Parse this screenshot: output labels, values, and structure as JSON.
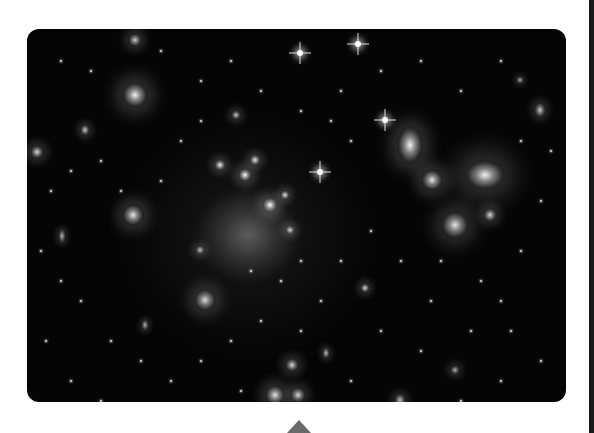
{
  "image": {
    "alt": "Grayscale telescope image of a galaxy cluster with many bright elliptical galaxies, diffraction-spike stars and faint arcs",
    "background_color": "#050505",
    "corner_radius_px": 12
  },
  "pointer": {
    "color": "#6a6a6a",
    "shape": "triangle-up"
  },
  "edge_bar": {
    "color": "#1a1a1a"
  },
  "galaxies": [
    {
      "x": 248,
      "y": 235,
      "w": 120,
      "h": 110,
      "b": 0.35
    },
    {
      "x": 270,
      "y": 205,
      "w": 16,
      "h": 16,
      "b": 1
    },
    {
      "x": 245,
      "y": 175,
      "w": 14,
      "h": 14,
      "b": 1
    },
    {
      "x": 220,
      "y": 165,
      "w": 12,
      "h": 12,
      "b": 0.95
    },
    {
      "x": 255,
      "y": 160,
      "w": 12,
      "h": 12,
      "b": 0.9
    },
    {
      "x": 285,
      "y": 195,
      "w": 10,
      "h": 10,
      "b": 0.9
    },
    {
      "x": 290,
      "y": 230,
      "w": 10,
      "h": 10,
      "b": 0.85
    },
    {
      "x": 410,
      "y": 145,
      "w": 26,
      "h": 38,
      "b": 0.95
    },
    {
      "x": 485,
      "y": 175,
      "w": 40,
      "h": 30,
      "b": 0.95
    },
    {
      "x": 432,
      "y": 180,
      "w": 22,
      "h": 22,
      "b": 0.9
    },
    {
      "x": 455,
      "y": 225,
      "w": 28,
      "h": 28,
      "b": 0.9
    },
    {
      "x": 490,
      "y": 215,
      "w": 14,
      "h": 14,
      "b": 0.85
    },
    {
      "x": 135,
      "y": 95,
      "w": 26,
      "h": 26,
      "b": 0.95
    },
    {
      "x": 133,
      "y": 215,
      "w": 22,
      "h": 22,
      "b": 0.9
    },
    {
      "x": 205,
      "y": 300,
      "w": 22,
      "h": 22,
      "b": 0.85
    },
    {
      "x": 275,
      "y": 395,
      "w": 20,
      "h": 20,
      "b": 0.9
    },
    {
      "x": 298,
      "y": 395,
      "w": 16,
      "h": 16,
      "b": 0.85
    },
    {
      "x": 292,
      "y": 365,
      "w": 14,
      "h": 14,
      "b": 0.85
    },
    {
      "x": 170,
      "y": 435,
      "w": 18,
      "h": 24,
      "b": 0.85
    },
    {
      "x": 135,
      "y": 40,
      "w": 14,
      "h": 14,
      "b": 0.8
    },
    {
      "x": 37,
      "y": 152,
      "w": 14,
      "h": 14,
      "b": 0.85
    },
    {
      "x": 540,
      "y": 110,
      "w": 12,
      "h": 16,
      "b": 0.8
    },
    {
      "x": 365,
      "y": 288,
      "w": 10,
      "h": 10,
      "b": 0.85
    },
    {
      "x": 236,
      "y": 115,
      "w": 10,
      "h": 10,
      "b": 0.8
    },
    {
      "x": 85,
      "y": 130,
      "w": 10,
      "h": 12,
      "b": 0.8
    },
    {
      "x": 326,
      "y": 353,
      "w": 8,
      "h": 12,
      "b": 0.75
    },
    {
      "x": 200,
      "y": 250,
      "w": 10,
      "h": 10,
      "b": 0.75
    },
    {
      "x": 62,
      "y": 236,
      "w": 8,
      "h": 16,
      "b": 0.7
    },
    {
      "x": 145,
      "y": 325,
      "w": 8,
      "h": 12,
      "b": 0.7
    },
    {
      "x": 520,
      "y": 80,
      "w": 8,
      "h": 8,
      "b": 0.7
    },
    {
      "x": 400,
      "y": 400,
      "w": 12,
      "h": 14,
      "b": 0.75
    },
    {
      "x": 530,
      "y": 415,
      "w": 12,
      "h": 10,
      "b": 0.7
    },
    {
      "x": 455,
      "y": 370,
      "w": 10,
      "h": 10,
      "b": 0.7
    }
  ],
  "stars": [
    {
      "x": 358,
      "y": 44
    },
    {
      "x": 300,
      "y": 53
    },
    {
      "x": 385,
      "y": 120
    },
    {
      "x": 320,
      "y": 172
    }
  ],
  "dots": [
    [
      60,
      60
    ],
    [
      90,
      70
    ],
    [
      160,
      50
    ],
    [
      200,
      80
    ],
    [
      230,
      60
    ],
    [
      260,
      90
    ],
    [
      300,
      110
    ],
    [
      340,
      90
    ],
    [
      380,
      70
    ],
    [
      420,
      60
    ],
    [
      460,
      90
    ],
    [
      500,
      60
    ],
    [
      520,
      140
    ],
    [
      550,
      150
    ],
    [
      540,
      200
    ],
    [
      520,
      250
    ],
    [
      500,
      300
    ],
    [
      470,
      330
    ],
    [
      430,
      300
    ],
    [
      400,
      260
    ],
    [
      370,
      230
    ],
    [
      340,
      260
    ],
    [
      320,
      300
    ],
    [
      300,
      330
    ],
    [
      260,
      320
    ],
    [
      230,
      340
    ],
    [
      200,
      360
    ],
    [
      170,
      380
    ],
    [
      140,
      360
    ],
    [
      110,
      340
    ],
    [
      80,
      300
    ],
    [
      60,
      280
    ],
    [
      40,
      250
    ],
    [
      50,
      190
    ],
    [
      70,
      170
    ],
    [
      100,
      160
    ],
    [
      120,
      190
    ],
    [
      160,
      180
    ],
    [
      180,
      140
    ],
    [
      200,
      120
    ],
    [
      350,
      140
    ],
    [
      330,
      120
    ],
    [
      440,
      260
    ],
    [
      480,
      280
    ],
    [
      510,
      330
    ],
    [
      540,
      360
    ],
    [
      500,
      380
    ],
    [
      460,
      400
    ],
    [
      420,
      350
    ],
    [
      380,
      330
    ],
    [
      350,
      380
    ],
    [
      320,
      410
    ],
    [
      240,
      390
    ],
    [
      210,
      410
    ],
    [
      100,
      400
    ],
    [
      70,
      380
    ],
    [
      45,
      340
    ],
    [
      250,
      270
    ],
    [
      280,
      280
    ],
    [
      300,
      260
    ]
  ]
}
